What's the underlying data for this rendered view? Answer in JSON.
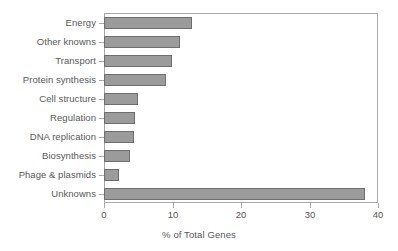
{
  "chart_data": {
    "type": "bar",
    "orientation": "horizontal",
    "title": "",
    "xlabel": "% of Total Genes",
    "ylabel": "",
    "xlim": [
      0,
      40
    ],
    "xticks": [
      0,
      10,
      20,
      30,
      40
    ],
    "xticklabels": [
      "0",
      "10",
      "20",
      "30",
      "40"
    ],
    "grid": false,
    "legend": false,
    "bar_color": "#9b9b9c",
    "bar_edge_color": "#6e6e70",
    "axis_color": "#a9a9ab",
    "text_color": "#58585a",
    "categories": [
      "Energy",
      "Other knowns",
      "Transport",
      "Protein synthesis",
      "Cell structure",
      "Regulation",
      "DNA replication",
      "Biosynthesis",
      "Phage & plasmids",
      "Unknowns"
    ],
    "values": [
      12.8,
      11.1,
      9.9,
      9.0,
      5.0,
      4.5,
      4.4,
      3.8,
      2.2,
      38.1
    ]
  }
}
